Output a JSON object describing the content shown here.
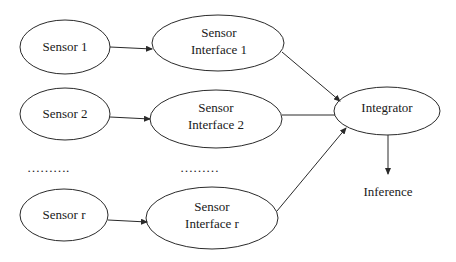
{
  "diagram": {
    "type": "block-diagram",
    "nodes": {
      "sensor_1": {
        "label": "Sensor 1"
      },
      "sensor_2": {
        "label": "Sensor 2"
      },
      "sensor_r": {
        "label": "Sensor r"
      },
      "interface_1": {
        "line1": "Sensor",
        "line2": "Interface 1"
      },
      "interface_2": {
        "line1": "Sensor",
        "line2": "Interface 2"
      },
      "interface_r": {
        "line1": "Sensor",
        "line2": "Interface r"
      },
      "integrator": {
        "label": "Integrator"
      },
      "inference": {
        "label": "Inference"
      }
    },
    "ellipsis": {
      "sensors": "……….",
      "interfaces": "………"
    },
    "edges": [
      {
        "from": "Sensor 1",
        "to": "Sensor Interface 1"
      },
      {
        "from": "Sensor 2",
        "to": "Sensor Interface 2"
      },
      {
        "from": "Sensor r",
        "to": "Sensor Interface r"
      },
      {
        "from": "Sensor Interface 1",
        "to": "Integrator"
      },
      {
        "from": "Sensor Interface 2",
        "to": "Integrator"
      },
      {
        "from": "Sensor Interface r",
        "to": "Integrator"
      },
      {
        "from": "Integrator",
        "to": "Inference"
      }
    ],
    "colors": {
      "stroke": "#2a2a2a",
      "background": "#ffffff"
    }
  }
}
